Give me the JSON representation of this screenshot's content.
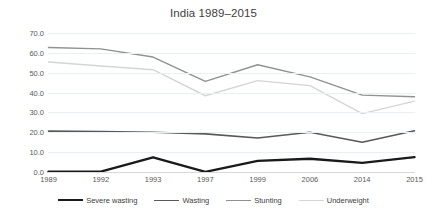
{
  "chart_data": {
    "type": "line",
    "title": "India 1989–2015",
    "xlabel": "",
    "ylabel": "",
    "categories": [
      "1989",
      "1992",
      "1993",
      "1997",
      "1999",
      "2006",
      "2014",
      "2015"
    ],
    "ylim": [
      0,
      70
    ],
    "ytick_labels": [
      "0.0",
      "10.0",
      "20.0",
      "30.0",
      "40.0",
      "50.0",
      "60.0",
      "70.0"
    ],
    "ytick_values": [
      0,
      10,
      20,
      30,
      40,
      50,
      60,
      70
    ],
    "grid": true,
    "legend_position": "bottom",
    "series": [
      {
        "name": "Severe wasting",
        "color": "#1a1a1a",
        "width": 2.4,
        "values": [
          0.2,
          0.2,
          7.4,
          0.1,
          5.6,
          6.7,
          4.6,
          7.5
        ]
      },
      {
        "name": "Wasting",
        "color": "#595959",
        "width": 1.6,
        "values": [
          20.6,
          20.4,
          20.0,
          19.2,
          17.1,
          20.0,
          15.0,
          20.8
        ]
      },
      {
        "name": "Stunting",
        "color": "#919191",
        "width": 1.4,
        "values": [
          62.7,
          62.0,
          57.9,
          45.6,
          54.0,
          47.9,
          38.7,
          37.9
        ]
      },
      {
        "name": "Underweight",
        "color": "#d5d5d5",
        "width": 1.4,
        "values": [
          55.4,
          53.4,
          51.5,
          38.4,
          46.0,
          43.5,
          29.4,
          35.7
        ]
      }
    ]
  },
  "colors": {
    "background": "#ffffff",
    "gridline": "#eceff1",
    "axis": "#d9d9d9",
    "title_text": "#404040",
    "tick_text": "#595959"
  }
}
